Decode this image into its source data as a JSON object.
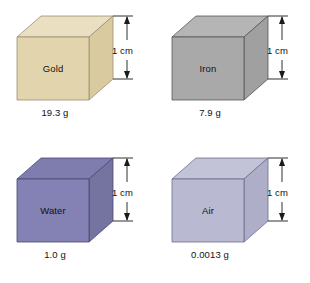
{
  "figure": {
    "dimension_label": "1 cm",
    "cells": [
      {
        "id": "gold",
        "material": "Gold",
        "mass": "19.3 g",
        "dimension": "1 cm",
        "colors": {
          "front": "#e2d5ad",
          "top": "#eadfc0",
          "side": "#d9caa0",
          "edge": "#9a8f72"
        }
      },
      {
        "id": "iron",
        "material": "Iron",
        "mass": "7.9 g",
        "dimension": "1 cm",
        "colors": {
          "front": "#a9a9a9",
          "top": "#b5b5b5",
          "side": "#a0a0a0",
          "edge": "#555555"
        }
      },
      {
        "id": "water",
        "material": "Water",
        "mass": "1.0 g",
        "dimension": "1 cm",
        "colors": {
          "front": "#8482b4",
          "top": "#7f7dae",
          "side": "#75739f",
          "edge": "#4a4872"
        }
      },
      {
        "id": "air",
        "material": "Air",
        "mass": "0.0013 g",
        "dimension": "1 cm",
        "colors": {
          "front": "#b9b9d2",
          "top": "#c3c3d8",
          "side": "#aeaec8",
          "edge": "#6d6d8c"
        }
      }
    ],
    "geometry": {
      "front": "17,37 89,37 89,100 17,100",
      "top": "17,37 41,16 113,16 89,37",
      "side": "89,37 113,16 113,79 89,100",
      "dim_x": 127,
      "dim_top_y": 16,
      "dim_bottom_y": 79
    }
  }
}
